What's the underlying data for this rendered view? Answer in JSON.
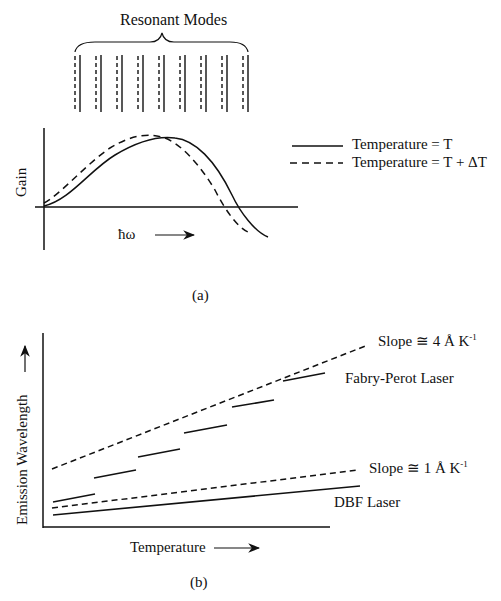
{
  "figure": {
    "panel_a": {
      "caption": "(a)",
      "title": "Resonant Modes",
      "mode_count": 9,
      "y_axis_label": "Gain",
      "x_axis_label": "ħω",
      "legend": [
        {
          "style": "solid",
          "label": "Temperature = T"
        },
        {
          "style": "dashed",
          "label": "Temperature = T + ΔT"
        }
      ]
    },
    "panel_b": {
      "caption": "(b)",
      "y_axis_label": "Emission Wavelength",
      "x_axis_label": "Temperature",
      "annotations": {
        "fp_slope": "Slope ≅ 4 Å K",
        "fp_slope_exp": "-1",
        "dbf_slope": "Slope ≅ 1 Å K",
        "dbf_slope_exp": "-1",
        "fp_label": "Fabry-Perot Laser",
        "dbf_label": "DBF Laser"
      }
    }
  },
  "colors": {
    "ink": "#111111",
    "background": "#ffffff"
  }
}
